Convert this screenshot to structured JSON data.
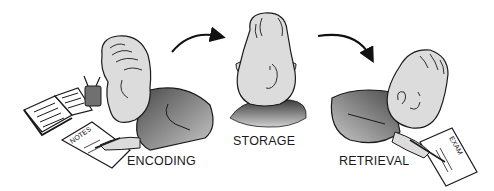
{
  "diagram": {
    "stages": [
      {
        "id": "encoding",
        "label": "ENCODING",
        "scene": "person writing notes from an open book, pencil cup nearby",
        "paper_label": "NOTES"
      },
      {
        "id": "storage",
        "label": "STORAGE",
        "scene": "person's head viewed from behind/above"
      },
      {
        "id": "retrieval",
        "label": "RETRIEVAL",
        "scene": "person writing on exam paper",
        "paper_label": "EXAM"
      }
    ],
    "arrows": [
      {
        "from": "encoding",
        "to": "storage",
        "icon": "curved-arrow-right-icon"
      },
      {
        "from": "storage",
        "to": "retrieval",
        "icon": "curved-arrow-down-right-icon"
      }
    ],
    "colors": {
      "skin": "#dcdcdc",
      "outline": "#1a1a1a",
      "shirt_dark": "#5a5a5a",
      "shirt_light": "#b8b8b8",
      "paper": "#ffffff",
      "cup": "#707070"
    }
  }
}
